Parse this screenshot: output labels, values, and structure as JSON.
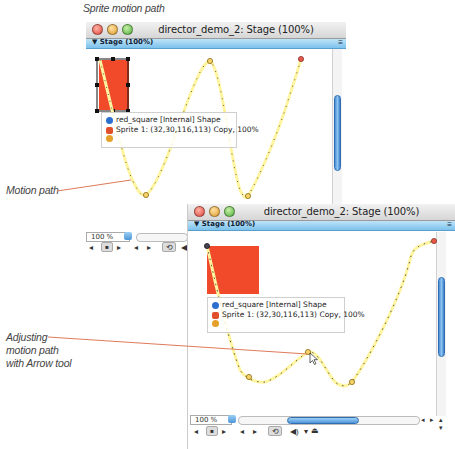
{
  "captions": {
    "top": "Sprite motion path",
    "motion_path": "Motion path",
    "adjusting_line1": "Adjusting",
    "adjusting_line2": "motion path",
    "adjusting_line3": "with Arrow tool"
  },
  "window1": {
    "title": "director_demo_2: Stage (100%)",
    "stage_label": "▼ Stage (100%)",
    "stage_menu_icon": "≡",
    "sprite_name": "red_square [Internal] Shape",
    "sprite_info": "Sprite 1: (32,30,116,113) Copy, 100%",
    "zoom_value": "100 %"
  },
  "window2": {
    "title": "director_demo_2: Stage (100%)",
    "stage_label": "▼ Stage (100%)",
    "stage_menu_icon": "≡",
    "sprite_name": "red_square [Internal] Shape",
    "sprite_info": "Sprite 1: (32,30,116,113) Copy, 100%",
    "zoom_value": "100 %"
  },
  "controls": {
    "rewind": "◂",
    "stop": "■",
    "play": "▸",
    "step_back": "◂",
    "step_fwd": "▸",
    "loop": "⟲",
    "volume": "◀)",
    "dropdown": "▾",
    "scroll_left": "◂",
    "scroll_right": "▸",
    "scroll_up": "▴",
    "scroll_down": "▾"
  },
  "colors": {
    "sprite_red": "#f04a2a",
    "callout_line": "#e07a5a",
    "path_yellow": "#fff5a0",
    "accent_blue": "#6fb6ee"
  }
}
